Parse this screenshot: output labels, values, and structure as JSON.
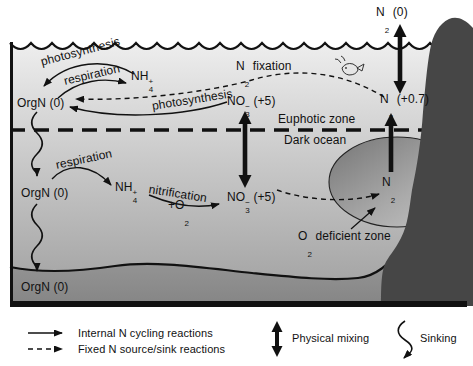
{
  "figure": "Marine nitrogen cycle schematic",
  "colors": {
    "ocean_top": "#eeeeee",
    "ocean_bottom": "#9e9e9e",
    "sediment_top": "#989898",
    "sediment_bottom": "#858585",
    "land": "#464646",
    "odz_dark": "#757575",
    "odz_light": "#c6c6c6",
    "line": "#111111"
  },
  "labels": {
    "n2_atmosphere": {
      "pre": "N",
      "sub": "2",
      "sup": "",
      "post": " (0)"
    },
    "photosynthesis_surface": "photosynthesis",
    "respiration_surface": "respiration",
    "nh4_surface": {
      "pre": "NH",
      "sub": "4",
      "sup": "+",
      "post": ""
    },
    "n2_fixation": {
      "pre": "N",
      "sub": "2",
      "sup": "",
      "post": " fixation"
    },
    "orgn_euphotic": "OrgN (0)",
    "photosynthesis_no3": "photosynthesis",
    "no3_euphotic": {
      "pre": "NO",
      "sub": "3",
      "sup": "−",
      "post": " (+5)"
    },
    "n2_subsurface": {
      "pre": "N",
      "sub": "2",
      "sup": "",
      "post": " (+0.7)"
    },
    "euphotic_zone": "Euphotic zone",
    "dark_ocean": "Dark ocean",
    "respiration_deep": "respiration",
    "nh4_deep": {
      "pre": "NH",
      "sub": "4",
      "sup": "+",
      "post": ""
    },
    "nitrification": "nitrification",
    "plus_o2": {
      "pre": "+O",
      "sub": "2",
      "sup": "",
      "post": ""
    },
    "no3_deep": {
      "pre": "NO",
      "sub": "3",
      "sup": "−",
      "post": " (+5)"
    },
    "n2_deep": {
      "pre": "N",
      "sub": "2",
      "sup": "",
      "post": ""
    },
    "o2_deficient_zone": {
      "pre": "O",
      "sub": "2",
      "sup": "",
      "post": " deficient zone"
    },
    "orgn_deep": "OrgN (0)",
    "orgn_sediment": "OrgN (0)"
  },
  "legend": {
    "internal": "Internal N cycling reactions",
    "fixed": "Fixed N source/sink reactions",
    "mixing": "Physical mixing",
    "sinking": "Sinking"
  }
}
